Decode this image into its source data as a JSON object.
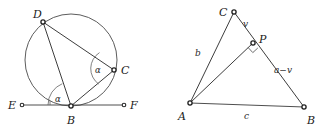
{
  "figure": {
    "background_color": "#ffffff",
    "line_color": "#3a3a3a",
    "label_color": "#1a1a1a",
    "caption": ""
  },
  "left_figure": {
    "name": "inscribed-angle-tangent-chord-circle",
    "circle": {
      "cx": 71,
      "cy": 60,
      "r": 46
    },
    "points": [
      {
        "id": "D",
        "label": "D",
        "x": 43,
        "y": 22,
        "label_x": 33,
        "label_y": 18
      },
      {
        "id": "C",
        "label": "C",
        "x": 114,
        "y": 70,
        "label_x": 121,
        "label_y": 72
      },
      {
        "id": "B",
        "label": "B",
        "x": 71,
        "y": 106,
        "label_x": 68,
        "label_y": 124
      },
      {
        "id": "E",
        "label": "E",
        "x": 22,
        "y": 105,
        "label_x": 9,
        "label_y": 108
      },
      {
        "id": "F",
        "label": "F",
        "x": 124,
        "y": 105,
        "label_x": 130,
        "label_y": 107
      }
    ],
    "segments": [
      {
        "from": "D",
        "to": "C"
      },
      {
        "from": "D",
        "to": "B"
      },
      {
        "from": "B",
        "to": "C"
      },
      {
        "from": "E",
        "to": "F"
      }
    ],
    "angles": [
      {
        "at": "C",
        "label": "α",
        "label_x": 96,
        "label_y": 73
      },
      {
        "at": "B",
        "label": "α",
        "label_x": 56,
        "label_y": 101
      }
    ]
  },
  "right_figure": {
    "name": "triangle-with-altitude-foot",
    "points": [
      {
        "id": "C",
        "label": "C",
        "x": 234,
        "y": 12,
        "label_x": 222,
        "label_y": 12
      },
      {
        "id": "P",
        "label": "P",
        "x": 253,
        "y": 43,
        "label_x": 260,
        "label_y": 41
      },
      {
        "id": "A",
        "label": "A",
        "x": 190,
        "y": 103,
        "label_x": 180,
        "label_y": 117
      },
      {
        "id": "B",
        "label": "B",
        "x": 304,
        "y": 107,
        "label_x": 308,
        "label_y": 121
      }
    ],
    "segments": [
      {
        "from": "C",
        "to": "A"
      },
      {
        "from": "C",
        "to": "B"
      },
      {
        "from": "A",
        "to": "B"
      },
      {
        "from": "A",
        "to": "P"
      }
    ],
    "side_labels": [
      {
        "text": "v",
        "x": 246,
        "y": 25,
        "name": "segment-label-v"
      },
      {
        "text": "b",
        "x": 197,
        "y": 53,
        "name": "segment-label-b"
      },
      {
        "text": "a−v",
        "x": 278,
        "y": 70,
        "name": "segment-label-a-minus-v"
      },
      {
        "text": "c",
        "x": 246,
        "y": 116,
        "name": "segment-label-c"
      }
    ],
    "right_angle": {
      "at": "P",
      "size": 7
    }
  }
}
